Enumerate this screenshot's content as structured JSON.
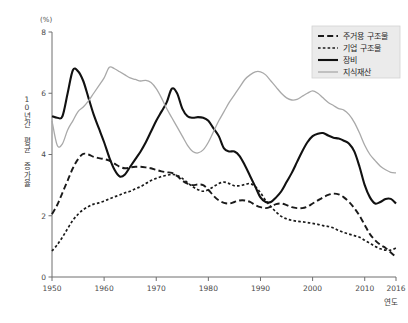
{
  "figure": {
    "unit_label": "(%)",
    "y_axis_title": "10년간 평균 증가율",
    "x_axis_title": "연도"
  },
  "legend": {
    "items": [
      {
        "label": "주거용 구조물",
        "style": "long-dash",
        "color": "#1a1a1a"
      },
      {
        "label": "기업 구조물",
        "style": "short-dash",
        "color": "#1a1a1a"
      },
      {
        "label": "장비",
        "style": "solid",
        "color": "#111111"
      },
      {
        "label": "지식재산",
        "style": "solid-light",
        "color": "#a9a9a9"
      }
    ]
  },
  "chart_data": {
    "type": "line",
    "title": "",
    "subtitle": "",
    "xlabel": "연도",
    "ylabel": "10년간 평균 증가율",
    "unit": "%",
    "xlim": [
      1950,
      2016
    ],
    "ylim": [
      0,
      8
    ],
    "xticks": [
      1950,
      1960,
      1970,
      1980,
      1990,
      2000,
      2010,
      2016
    ],
    "yticks": [
      0,
      2,
      4,
      6,
      8
    ],
    "grid": false,
    "legend_position": "top-right",
    "x": [
      1950,
      1951,
      1952,
      1953,
      1954,
      1955,
      1956,
      1957,
      1958,
      1959,
      1960,
      1961,
      1962,
      1963,
      1964,
      1965,
      1966,
      1967,
      1968,
      1969,
      1970,
      1971,
      1972,
      1973,
      1974,
      1975,
      1976,
      1977,
      1978,
      1979,
      1980,
      1981,
      1982,
      1983,
      1984,
      1985,
      1986,
      1987,
      1988,
      1989,
      1990,
      1991,
      1992,
      1993,
      1994,
      1995,
      1996,
      1997,
      1998,
      1999,
      2000,
      2001,
      2002,
      2003,
      2004,
      2005,
      2006,
      2007,
      2008,
      2009,
      2010,
      2011,
      2012,
      2013,
      2014,
      2015,
      2016
    ],
    "series": [
      {
        "name": "주거용 구조물",
        "style": "long-dash",
        "color": "#1a1a1a",
        "values": [
          2.05,
          2.35,
          2.75,
          3.15,
          3.55,
          3.85,
          4.02,
          4.0,
          3.92,
          3.88,
          3.85,
          3.8,
          3.7,
          3.6,
          3.55,
          3.58,
          3.6,
          3.6,
          3.58,
          3.55,
          3.5,
          3.45,
          3.42,
          3.4,
          3.3,
          3.15,
          3.05,
          3.0,
          3.02,
          3.0,
          2.85,
          2.65,
          2.5,
          2.42,
          2.4,
          2.45,
          2.5,
          2.5,
          2.45,
          2.35,
          2.28,
          2.25,
          2.3,
          2.38,
          2.4,
          2.35,
          2.28,
          2.25,
          2.25,
          2.3,
          2.4,
          2.5,
          2.6,
          2.68,
          2.72,
          2.7,
          2.6,
          2.45,
          2.25,
          2.0,
          1.7,
          1.4,
          1.2,
          1.05,
          0.95,
          0.8,
          0.65
        ]
      },
      {
        "name": "기업 구조물",
        "style": "short-dash",
        "color": "#1a1a1a",
        "values": [
          0.85,
          1.05,
          1.3,
          1.58,
          1.85,
          2.05,
          2.2,
          2.3,
          2.38,
          2.42,
          2.48,
          2.55,
          2.62,
          2.68,
          2.75,
          2.8,
          2.88,
          2.95,
          3.05,
          3.15,
          3.22,
          3.28,
          3.32,
          3.35,
          3.32,
          3.22,
          3.08,
          2.95,
          2.85,
          2.8,
          2.85,
          2.95,
          3.05,
          3.1,
          3.05,
          2.98,
          2.98,
          3.02,
          3.05,
          2.95,
          2.75,
          2.5,
          2.3,
          2.12,
          1.98,
          1.9,
          1.85,
          1.82,
          1.8,
          1.78,
          1.75,
          1.72,
          1.68,
          1.65,
          1.6,
          1.52,
          1.45,
          1.4,
          1.35,
          1.3,
          1.2,
          1.1,
          1.0,
          0.92,
          0.88,
          0.88,
          0.95
        ]
      },
      {
        "name": "장비",
        "style": "solid",
        "color": "#111111",
        "values": [
          5.25,
          5.2,
          5.25,
          6.0,
          6.75,
          6.72,
          6.4,
          5.85,
          5.3,
          4.85,
          4.4,
          3.9,
          3.5,
          3.28,
          3.35,
          3.6,
          3.85,
          4.1,
          4.4,
          4.75,
          5.1,
          5.4,
          5.7,
          6.15,
          6.0,
          5.5,
          5.25,
          5.2,
          5.22,
          5.2,
          5.1,
          4.85,
          4.6,
          4.2,
          4.1,
          4.1,
          3.95,
          3.65,
          3.3,
          2.95,
          2.6,
          2.45,
          2.45,
          2.6,
          2.8,
          3.1,
          3.4,
          3.75,
          4.1,
          4.4,
          4.6,
          4.68,
          4.7,
          4.62,
          4.55,
          4.52,
          4.45,
          4.35,
          4.1,
          3.6,
          3.0,
          2.6,
          2.4,
          2.45,
          2.55,
          2.55,
          2.4
        ]
      },
      {
        "name": "지식재산",
        "style": "solid-light",
        "color": "#a9a9a9",
        "values": [
          5.1,
          4.3,
          4.35,
          4.8,
          5.1,
          5.4,
          5.55,
          5.75,
          6.0,
          6.25,
          6.5,
          6.85,
          6.8,
          6.7,
          6.6,
          6.5,
          6.45,
          6.4,
          6.42,
          6.35,
          6.15,
          5.85,
          5.5,
          5.2,
          4.9,
          4.6,
          4.3,
          4.1,
          4.05,
          4.15,
          4.4,
          4.75,
          5.1,
          5.4,
          5.7,
          5.95,
          6.2,
          6.45,
          6.6,
          6.7,
          6.7,
          6.6,
          6.4,
          6.2,
          6.0,
          5.85,
          5.78,
          5.8,
          5.9,
          6.0,
          6.08,
          6.0,
          5.85,
          5.7,
          5.6,
          5.5,
          5.45,
          5.3,
          5.05,
          4.7,
          4.3,
          4.0,
          3.8,
          3.62,
          3.5,
          3.42,
          3.4
        ]
      }
    ]
  }
}
